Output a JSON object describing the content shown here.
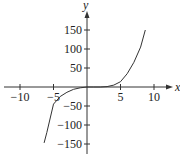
{
  "chart_data": {
    "type": "line",
    "title": "",
    "xlabel": "x",
    "ylabel": "y",
    "xlim": [
      -11,
      12
    ],
    "ylim": [
      -160,
      180
    ],
    "grid": false,
    "legend": null,
    "x_ticks": [
      -10,
      -5,
      5,
      10
    ],
    "y_ticks": [
      150,
      100,
      50,
      -50,
      -100,
      -150
    ],
    "x_tick_labels": [
      "−10",
      "−5",
      "5",
      "10"
    ],
    "y_tick_labels": [
      "150",
      "100",
      "50",
      "−50",
      "−100",
      "−150"
    ],
    "series": [
      {
        "name": "f(x)",
        "x": [
          -6.4,
          -6,
          -5,
          -4,
          -3,
          -2,
          -1,
          0,
          1,
          2,
          3,
          4,
          5,
          6,
          7,
          8,
          8.7
        ],
        "y": [
          -147,
          -120,
          -45,
          -25,
          -14,
          -6,
          -2,
          0,
          0,
          0,
          1,
          5,
          14,
          35,
          65,
          105,
          150
        ]
      }
    ]
  }
}
